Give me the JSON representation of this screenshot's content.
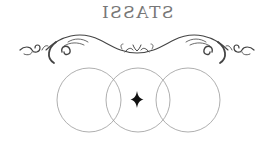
{
  "logo": {
    "text": "STASSI",
    "mirrored": true,
    "text_color": "#777777"
  },
  "ornament": {
    "flourish_color": "#444444",
    "circle_color": "#9a9a9a",
    "star_color": "#111111",
    "circle_count": 3
  }
}
